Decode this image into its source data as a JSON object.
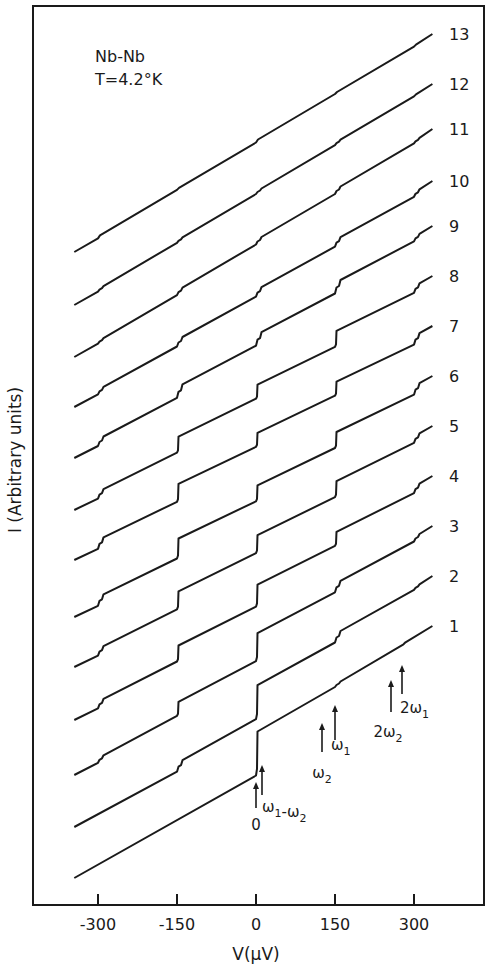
{
  "chart_data": {
    "type": "line",
    "title": "Nb-Nb",
    "subtitle": "T=4.2°K",
    "xlabel": "V (µV)",
    "ylabel": "I (Arbitrary units)",
    "xlim": [
      -400,
      350
    ],
    "x_ticks": [
      -300,
      -150,
      0,
      150,
      300
    ],
    "x_tick_labels": [
      "-300",
      "-150",
      "0",
      "150",
      "300"
    ],
    "grid": false,
    "legend": "curve numbers 1-13 labelled at right end of each trace",
    "series_offset_note": "Curves vertically offset; I in arbitrary units",
    "x_range_of_traces": [
      -345,
      335
    ],
    "series": [
      {
        "name": "1",
        "start_y": 878,
        "end_y": 626,
        "steps": [
          {
            "v": 0,
            "h": 44
          },
          {
            "v": 150,
            "h": 4
          },
          {
            "v": 280,
            "h": 2
          }
        ]
      },
      {
        "name": "2",
        "start_y": 827,
        "end_y": 576,
        "steps": [
          {
            "v": -150,
            "h": 10
          },
          {
            "v": 0,
            "h": 34
          },
          {
            "v": 150,
            "h": 10
          },
          {
            "v": 300,
            "h": 4
          }
        ]
      },
      {
        "name": "3",
        "start_y": 775,
        "end_y": 526,
        "steps": [
          {
            "v": -300,
            "h": 6
          },
          {
            "v": -150,
            "h": 14
          },
          {
            "v": 0,
            "h": 28
          },
          {
            "v": 150,
            "h": 10
          },
          {
            "v": 300,
            "h": 6
          }
        ]
      },
      {
        "name": "4",
        "start_y": 720,
        "end_y": 476,
        "steps": [
          {
            "v": -300,
            "h": 8
          },
          {
            "v": -150,
            "h": 16
          },
          {
            "v": 0,
            "h": 22
          },
          {
            "v": 150,
            "h": 14
          },
          {
            "v": 300,
            "h": 8
          }
        ]
      },
      {
        "name": "5",
        "start_y": 667,
        "end_y": 426,
        "steps": [
          {
            "v": -300,
            "h": 8
          },
          {
            "v": -150,
            "h": 18
          },
          {
            "v": 0,
            "h": 18
          },
          {
            "v": 150,
            "h": 16
          },
          {
            "v": 300,
            "h": 8
          }
        ]
      },
      {
        "name": "6",
        "start_y": 617,
        "end_y": 376,
        "steps": [
          {
            "v": -300,
            "h": 10
          },
          {
            "v": -150,
            "h": 20
          },
          {
            "v": 0,
            "h": 16
          },
          {
            "v": 150,
            "h": 16
          },
          {
            "v": 300,
            "h": 10
          }
        ]
      },
      {
        "name": "7",
        "start_y": 560,
        "end_y": 326,
        "steps": [
          {
            "v": -300,
            "h": 10
          },
          {
            "v": -150,
            "h": 18
          },
          {
            "v": 0,
            "h": 14
          },
          {
            "v": 150,
            "h": 14
          },
          {
            "v": 300,
            "h": 10
          }
        ]
      },
      {
        "name": "8",
        "start_y": 510,
        "end_y": 276,
        "steps": [
          {
            "v": -300,
            "h": 8
          },
          {
            "v": -150,
            "h": 16
          },
          {
            "v": 0,
            "h": 14
          },
          {
            "v": 150,
            "h": 16
          },
          {
            "v": 300,
            "h": 8
          }
        ]
      },
      {
        "name": "9",
        "start_y": 458,
        "end_y": 226,
        "steps": [
          {
            "v": -300,
            "h": 8
          },
          {
            "v": -150,
            "h": 12
          },
          {
            "v": 0,
            "h": 12
          },
          {
            "v": 150,
            "h": 12
          },
          {
            "v": 300,
            "h": 6
          }
        ]
      },
      {
        "name": "10",
        "start_y": 407,
        "end_y": 181,
        "steps": [
          {
            "v": -300,
            "h": 6
          },
          {
            "v": -150,
            "h": 8
          },
          {
            "v": 0,
            "h": 8
          },
          {
            "v": 150,
            "h": 8
          },
          {
            "v": 300,
            "h": 6
          }
        ]
      },
      {
        "name": "11",
        "start_y": 357,
        "end_y": 129,
        "steps": [
          {
            "v": -300,
            "h": 4
          },
          {
            "v": -150,
            "h": 6
          },
          {
            "v": 0,
            "h": 6
          },
          {
            "v": 150,
            "h": 6
          },
          {
            "v": 300,
            "h": 4
          }
        ]
      },
      {
        "name": "12",
        "start_y": 305,
        "end_y": 84,
        "steps": [
          {
            "v": -300,
            "h": 4
          },
          {
            "v": -150,
            "h": 4
          },
          {
            "v": 0,
            "h": 4
          },
          {
            "v": 150,
            "h": 4
          },
          {
            "v": 300,
            "h": 2
          }
        ]
      },
      {
        "name": "13",
        "start_y": 252,
        "end_y": 34,
        "steps": [
          {
            "v": -300,
            "h": 3
          },
          {
            "v": -150,
            "h": 2
          },
          {
            "v": 0,
            "h": 3
          },
          {
            "v": 150,
            "h": 2
          },
          {
            "v": 300,
            "h": 2
          }
        ]
      }
    ],
    "annotations": [
      {
        "label": "0",
        "v": 0,
        "type": "arrow"
      },
      {
        "label": "ω1-ω2",
        "v": 8,
        "type": "arrow"
      },
      {
        "label": "ω2",
        "v": 128,
        "type": "arrow"
      },
      {
        "label": "ω1",
        "v": 150,
        "type": "arrow"
      },
      {
        "label": "2ω2",
        "v": 268,
        "type": "arrow"
      },
      {
        "label": "2ω1",
        "v": 290,
        "type": "arrow"
      }
    ]
  },
  "header": {
    "line1": "Nb-Nb",
    "line2": "T=4.2°K"
  },
  "axes": {
    "xlabel": "V(µV)",
    "ylabel": "I (Arbitrary units)"
  },
  "colors": {
    "ink": "#1a1a1a",
    "background": "#ffffff"
  }
}
